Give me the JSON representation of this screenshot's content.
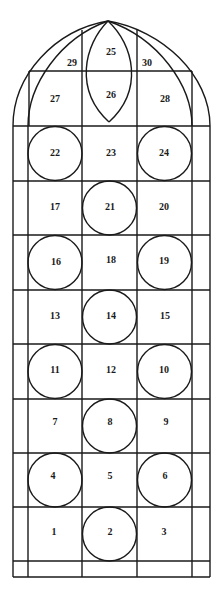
{
  "diagram": {
    "colors": {
      "line": "#1a1a1a",
      "background": "#ffffff"
    },
    "columns_x": [
      13,
      28,
      82,
      137,
      192,
      210
    ],
    "rows_y": [
      71,
      126,
      181,
      235,
      290,
      344,
      399,
      453,
      507,
      561,
      577
    ],
    "apex": [
      108,
      21
    ],
    "tracery": {
      "labels": {
        "p25": "25",
        "p26": "26",
        "p27": "27",
        "p28": "28",
        "p29": "29",
        "p30": "30"
      }
    },
    "rows": [
      {
        "y0": 126,
        "y1": 181,
        "cells": [
          {
            "label": "22",
            "circle": true
          },
          {
            "label": "23",
            "circle": false
          },
          {
            "label": "24",
            "circle": true
          }
        ]
      },
      {
        "y0": 181,
        "y1": 235,
        "cells": [
          {
            "label": "17",
            "circle": false
          },
          {
            "label": "21",
            "circle": true
          },
          {
            "label": "20",
            "circle": false
          }
        ]
      },
      {
        "y0": 235,
        "y1": 290,
        "cells": [
          {
            "label": "16",
            "circle": true
          },
          {
            "label": "18",
            "circle": false
          },
          {
            "label": "19",
            "circle": true
          }
        ]
      },
      {
        "y0": 290,
        "y1": 344,
        "cells": [
          {
            "label": "13",
            "circle": false
          },
          {
            "label": "14",
            "circle": true
          },
          {
            "label": "15",
            "circle": false
          }
        ]
      },
      {
        "y0": 344,
        "y1": 399,
        "cells": [
          {
            "label": "11",
            "circle": true
          },
          {
            "label": "12",
            "circle": false
          },
          {
            "label": "10",
            "circle": true
          }
        ]
      },
      {
        "y0": 399,
        "y1": 453,
        "cells": [
          {
            "label": "7",
            "circle": false
          },
          {
            "label": "8",
            "circle": true
          },
          {
            "label": "9",
            "circle": false
          }
        ]
      },
      {
        "y0": 453,
        "y1": 507,
        "cells": [
          {
            "label": "4",
            "circle": true
          },
          {
            "label": "5",
            "circle": false
          },
          {
            "label": "6",
            "circle": true
          }
        ]
      },
      {
        "y0": 507,
        "y1": 561,
        "cells": [
          {
            "label": "1",
            "circle": false
          },
          {
            "label": "2",
            "circle": true
          },
          {
            "label": "3",
            "circle": false
          }
        ]
      }
    ]
  }
}
